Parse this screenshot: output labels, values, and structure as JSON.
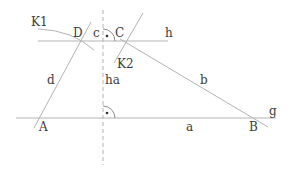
{
  "diagram": {
    "type": "geometric construction",
    "colors": {
      "line": "#b4b4b4",
      "text": "#3c3c3c",
      "background": "#ffffff"
    },
    "labels": {
      "K1": "K1",
      "K2": "K2",
      "D": "D",
      "C": "C",
      "c": "c",
      "h": "h",
      "d": "d",
      "ha": "ha",
      "b": "b",
      "g": "g",
      "A": "A",
      "a": "a",
      "B": "B"
    },
    "points": {
      "A": [
        38,
        118
      ],
      "B": [
        250,
        118
      ],
      "C": [
        123,
        41
      ],
      "D": [
        80,
        41
      ]
    },
    "right_angle_marks": 2
  }
}
